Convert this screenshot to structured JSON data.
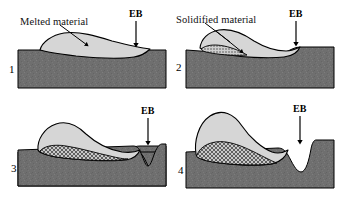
{
  "figure": {
    "background_color": "#ffffff",
    "panel_count": 4
  },
  "colors": {
    "substrate": "#6f6f6f",
    "substrate_dark": "#5e5e5e",
    "melt": "#d6d6d6",
    "solidified_hatch_fill": "#b5b5b5",
    "outline": "#000000",
    "cavity": "#ffffff",
    "text": "#000000"
  },
  "annotations": {
    "melted_material": "Melted material",
    "solidified_material": "Solidified material",
    "beam_label": "EB"
  },
  "panels": [
    {
      "number": "1",
      "eb_label": "EB",
      "callout": "Melted material",
      "has_callout": true,
      "has_solidified": false,
      "cavity": "none",
      "description": "Shallow melt pool spread on flat substrate, beam at right edge of pool"
    },
    {
      "number": "2",
      "eb_label": "EB",
      "callout": "Solidified material",
      "has_callout": true,
      "has_solidified": true,
      "cavity": "shallow",
      "description": "Melt pool thickens at left, thin solidified sliver forms at trailing edge, slight depression under beam"
    },
    {
      "number": "3",
      "eb_label": "EB",
      "callout": "",
      "has_callout": false,
      "has_solidified": true,
      "cavity": "v-groove",
      "description": "Raised bead with crosshatched solidified layer beneath; narrow V shaped cavity under the beam"
    },
    {
      "number": "4",
      "eb_label": "EB",
      "callout": "",
      "has_callout": false,
      "has_solidified": true,
      "cavity": "deep-u-groove",
      "description": "Tall bead with large crosshatched solidified region; deep U shaped cavity under the beam"
    }
  ]
}
